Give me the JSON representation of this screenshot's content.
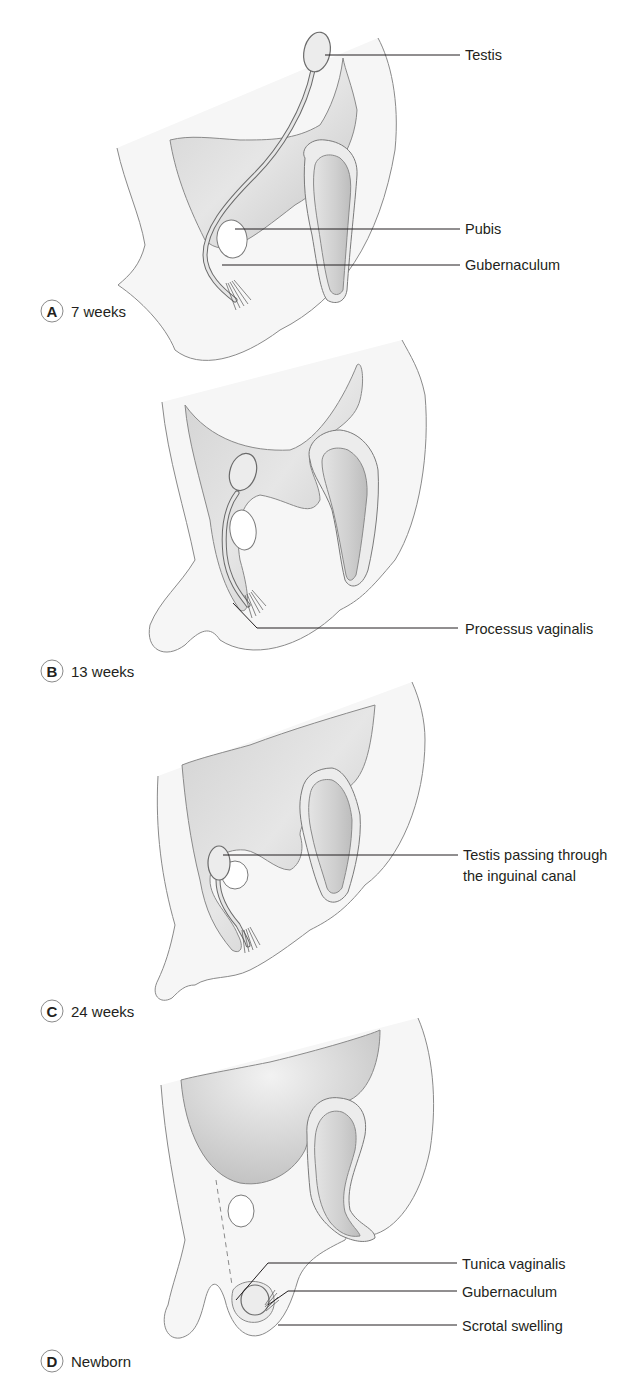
{
  "figure": {
    "panels": [
      {
        "letter": "A",
        "stage": "7 weeks",
        "labels": [
          {
            "text": "Testis"
          },
          {
            "text": "Pubis"
          },
          {
            "text": "Gubernaculum"
          }
        ]
      },
      {
        "letter": "B",
        "stage": "13 weeks",
        "labels": [
          {
            "text": "Processus vaginalis"
          }
        ]
      },
      {
        "letter": "C",
        "stage": "24 weeks",
        "labels": [
          {
            "line1": "Testis passing through",
            "line2": "the inguinal canal"
          }
        ]
      },
      {
        "letter": "D",
        "stage": "Newborn",
        "labels": [
          {
            "text": "Tunica vaginalis"
          },
          {
            "text": "Gubernaculum"
          },
          {
            "text": "Scrotal swelling"
          }
        ]
      }
    ],
    "colors": {
      "text": "#231f20",
      "outline": "#8a8a8a",
      "fill_light": "#f6f6f6",
      "fill_dark": "#c9c9c9"
    }
  }
}
